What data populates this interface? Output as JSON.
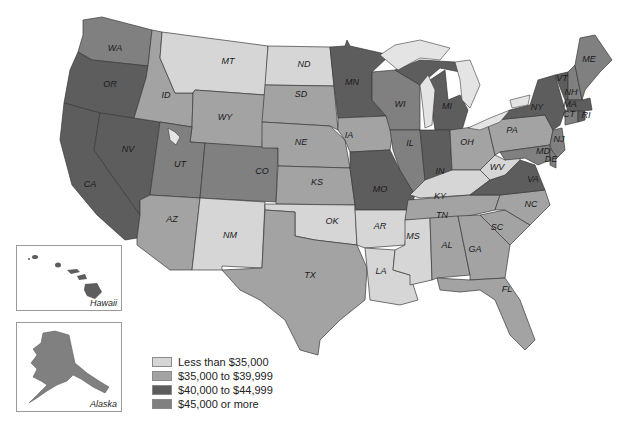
{
  "colors": {
    "less_35": "#d6d6d6",
    "35_39": "#a3a3a3",
    "40_44": "#5d5d5d",
    "45_plus": "#808080"
  },
  "legend": {
    "items": [
      {
        "label": "Less than $35,000",
        "key": "less_35"
      },
      {
        "label": "$35,000 to $39,999",
        "key": "35_39"
      },
      {
        "label": "$40,000 to $44,999",
        "key": "40_44"
      },
      {
        "label": "$45,000 or more",
        "key": "45_plus"
      }
    ]
  },
  "insets": {
    "hawaii": {
      "label": "Hawaii",
      "category": "40_44"
    },
    "alaska": {
      "label": "Alaska",
      "category": "45_plus"
    }
  },
  "states": {
    "WA": "45_plus",
    "OR": "40_44",
    "CA": "40_44",
    "NV": "40_44",
    "ID": "35_39",
    "MT": "less_35",
    "WY": "35_39",
    "UT": "45_plus",
    "CO": "45_plus",
    "AZ": "35_39",
    "NM": "less_35",
    "ND": "less_35",
    "SD": "35_39",
    "NE": "35_39",
    "KS": "35_39",
    "OK": "less_35",
    "TX": "35_39",
    "MN": "40_44",
    "IA": "35_39",
    "MO": "40_44",
    "AR": "less_35",
    "LA": "less_35",
    "WI": "45_plus",
    "IL": "45_plus",
    "MI": "40_44",
    "IN": "40_44",
    "OH": "35_39",
    "KY": "less_35",
    "TN": "35_39",
    "MS": "less_35",
    "AL": "35_39",
    "GA": "35_39",
    "FL": "35_39",
    "SC": "35_39",
    "NC": "35_39",
    "VA": "40_44",
    "WV": "less_35",
    "PA": "35_39",
    "NY": "40_44",
    "VT": "40_44",
    "NH": "45_plus",
    "ME": "45_plus",
    "MA": "40_44",
    "CT": "45_plus",
    "RI": "40_44",
    "NJ": "45_plus",
    "DE": "45_plus",
    "MD": "45_plus"
  },
  "labels": {
    "WA": "WA",
    "OR": "OR",
    "CA": "CA",
    "NV": "NV",
    "ID": "ID",
    "MT": "MT",
    "WY": "WY",
    "UT": "UT",
    "CO": "CO",
    "AZ": "AZ",
    "NM": "NM",
    "ND": "ND",
    "SD": "SD",
    "NE": "NE",
    "KS": "KS",
    "OK": "OK",
    "TX": "TX",
    "MN": "MN",
    "IA": "IA",
    "MO": "MO",
    "AR": "AR",
    "LA": "LA",
    "WI": "WI",
    "IL": "IL",
    "MI": "MI",
    "IN": "IN",
    "OH": "OH",
    "KY": "KY",
    "TN": "TN",
    "MS": "MS",
    "AL": "AL",
    "GA": "GA",
    "FL": "FL",
    "SC": "SC",
    "NC": "NC",
    "VA": "VA",
    "WV": "WV",
    "PA": "PA",
    "NY": "NY",
    "VT": "VT",
    "NH": "NH",
    "ME": "ME",
    "MA": "MA",
    "CT": "CT",
    "RI": "RI",
    "NJ": "NJ",
    "DE": "DE",
    "MD": "MD"
  }
}
